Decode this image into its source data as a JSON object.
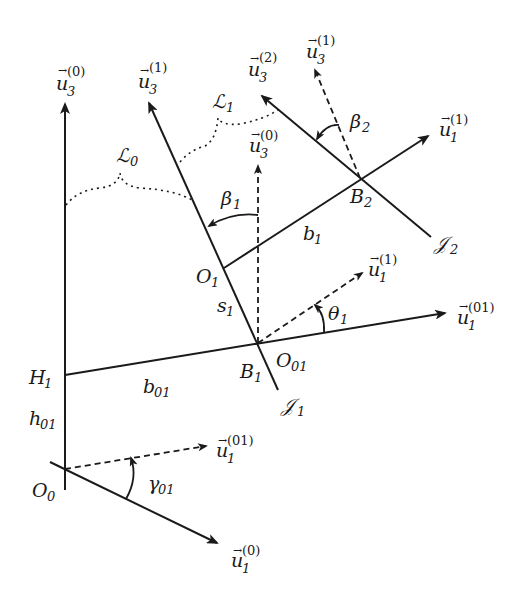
{
  "diagram": {
    "type": "kinematic-frames",
    "colors": {
      "stroke": "#1a1a1a",
      "background": "#ffffff"
    },
    "points": {
      "O0": {
        "label": "O",
        "sub": "0"
      },
      "H1": {
        "label": "H",
        "sub": "1"
      },
      "B1": {
        "label": "B",
        "sub": "1"
      },
      "O01": {
        "label": "O",
        "sub": "01"
      },
      "O1": {
        "label": "O",
        "sub": "1"
      },
      "B2": {
        "label": "B",
        "sub": "2"
      }
    },
    "lengths": {
      "h01": {
        "label": "h",
        "sub": "01"
      },
      "b01": {
        "label": "b",
        "sub": "01"
      },
      "s1": {
        "label": "s",
        "sub": "1"
      },
      "b1": {
        "label": "b",
        "sub": "1"
      }
    },
    "angles": {
      "gamma01": {
        "label": "γ",
        "sub": "01"
      },
      "theta1": {
        "label": "θ",
        "sub": "1"
      },
      "beta1": {
        "label": "β",
        "sub": "1"
      },
      "beta2": {
        "label": "β",
        "sub": "2"
      }
    },
    "axes": {
      "J1": {
        "label": "𝒥",
        "sub": "1"
      },
      "J2": {
        "label": "𝒥",
        "sub": "2"
      }
    },
    "links": {
      "L0": {
        "label": "ℒ",
        "sub": "0"
      },
      "L1": {
        "label": "ℒ",
        "sub": "1"
      }
    },
    "vectors": {
      "u3_0_top": {
        "label": "u",
        "arrow": "→",
        "sub": "3",
        "sup": "(0)"
      },
      "u3_1_top": {
        "label": "u",
        "arrow": "→",
        "sub": "3",
        "sup": "(1)"
      },
      "u3_2": {
        "label": "u",
        "arrow": "→",
        "sub": "3",
        "sup": "(2)"
      },
      "u3_1_dashed": {
        "label": "u",
        "arrow": "→",
        "sub": "3",
        "sup": "(1)"
      },
      "u3_0_dashed": {
        "label": "u",
        "arrow": "→",
        "sub": "3",
        "sup": "(0)"
      },
      "u1_1_top": {
        "label": "u",
        "arrow": "→",
        "sub": "1",
        "sup": "(1)"
      },
      "u1_1_dashed": {
        "label": "u",
        "arrow": "→",
        "sub": "1",
        "sup": "(1)"
      },
      "u1_01_solid": {
        "label": "u",
        "arrow": "→",
        "sub": "1",
        "sup": "(01)"
      },
      "u1_01_dashed": {
        "label": "u",
        "arrow": "→",
        "sub": "1",
        "sup": "(01)"
      },
      "u1_0": {
        "label": "u",
        "arrow": "→",
        "sub": "1",
        "sup": "(0)"
      }
    }
  }
}
